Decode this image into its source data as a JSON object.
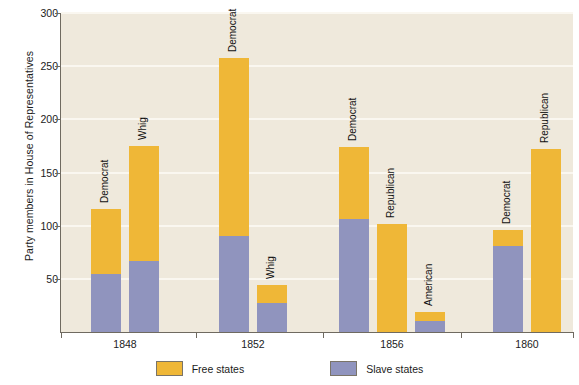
{
  "chart_data": {
    "type": "bar",
    "title": "",
    "xlabel": "",
    "ylabel": "Party members in House of Representatives",
    "ylim": [
      0,
      300
    ],
    "yticks": [
      0,
      50,
      100,
      150,
      200,
      250,
      300
    ],
    "ytick_labels": [
      "",
      "50",
      "100",
      "150",
      "200",
      "250",
      "300"
    ],
    "grid": true,
    "stacked": true,
    "legend_position": "bottom",
    "categories": [
      "1848",
      "1852",
      "1856",
      "1860"
    ],
    "series": [
      {
        "name": "Free states",
        "color": "#efb737"
      },
      {
        "name": "Slave states",
        "color": "#9094be"
      }
    ],
    "groups": [
      {
        "year": "1848",
        "bars": [
          {
            "party": "Democrat",
            "slave_states": 55,
            "free_states": 61,
            "total": 116
          },
          {
            "party": "Whig",
            "slave_states": 67,
            "free_states": 108,
            "total": 175
          }
        ]
      },
      {
        "year": "1852",
        "bars": [
          {
            "party": "Democrat",
            "slave_states": 90,
            "free_states": 168,
            "total": 258
          },
          {
            "party": "Whig",
            "slave_states": 27,
            "free_states": 17,
            "total": 44
          }
        ]
      },
      {
        "year": "1856",
        "bars": [
          {
            "party": "Democrat",
            "slave_states": 106,
            "free_states": 68,
            "total": 174
          },
          {
            "party": "Republican",
            "slave_states": 0,
            "free_states": 102,
            "total": 102
          },
          {
            "party": "American",
            "slave_states": 10,
            "free_states": 9,
            "total": 19
          }
        ]
      },
      {
        "year": "1860",
        "bars": [
          {
            "party": "Democrat",
            "slave_states": 81,
            "free_states": 15,
            "total": 96
          },
          {
            "party": "Republican",
            "slave_states": 0,
            "free_states": 172,
            "total": 172
          }
        ]
      }
    ]
  },
  "legend": {
    "items": [
      {
        "label": "Free states",
        "color": "#efb737"
      },
      {
        "label": "Slave states",
        "color": "#9094be"
      }
    ]
  },
  "colors": {
    "free_states": "#efb737",
    "slave_states": "#9094be",
    "plot_background": "#efe9dc",
    "gridline": "#faf7f0",
    "axis": "#6f6a60",
    "page_background": "#ffffff"
  }
}
